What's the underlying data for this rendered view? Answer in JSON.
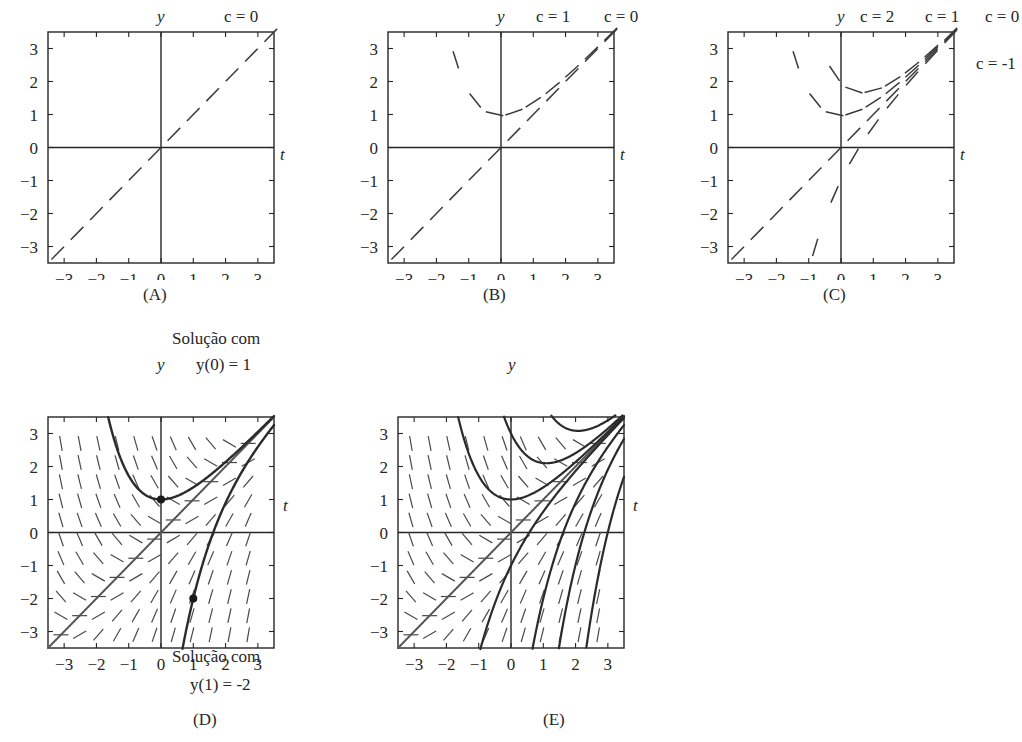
{
  "figure": {
    "background": "#ffffff",
    "ink": "#262626",
    "curve_color": "#3a3a3a",
    "accent_curve_color": "#555555"
  },
  "axes_common": {
    "x_ticks": [
      "-3",
      "-2",
      "-1",
      "0",
      "1",
      "2",
      "3"
    ],
    "y_ticks": [
      "3",
      "2",
      "1",
      "0",
      "-1",
      "-2",
      "-3"
    ],
    "x_label": "t",
    "y_label": "y",
    "xlim": [
      -3.5,
      3.5
    ],
    "ylim": [
      -3.5,
      3.5
    ]
  },
  "panels": [
    {
      "id": "A",
      "caption": "(A)",
      "curve_labels": [
        "c = 0"
      ],
      "has_direction_field": false,
      "has_solution_curves": false,
      "dashed_curves": [
        {
          "c": 0,
          "label": "c = 0",
          "label_x": 0.76,
          "style": "dashed"
        }
      ]
    },
    {
      "id": "B",
      "caption": "(B)",
      "curve_labels": [
        "c = 1",
        "c = 0"
      ],
      "has_direction_field": false,
      "has_solution_curves": false,
      "dashed_curves": [
        {
          "c": 1,
          "label": "c = 1",
          "label_x": 0.57,
          "style": "dashed"
        },
        {
          "c": 0,
          "label": "c = 0",
          "label_x": 0.84,
          "style": "dashed"
        }
      ]
    },
    {
      "id": "C",
      "caption": "(C)",
      "curve_labels": [
        "c = 2",
        "c = 1",
        "c = 0",
        "c = -1"
      ],
      "has_direction_field": false,
      "has_solution_curves": false,
      "dashed_curves": [
        {
          "c": 2,
          "label": "c = 2",
          "label_x": 0.41,
          "style": "dashed"
        },
        {
          "c": 1,
          "label": "c = 1",
          "label_x": 0.62,
          "style": "dashed"
        },
        {
          "c": 0,
          "label": "c = 0",
          "label_x": 0.83,
          "style": "dashed"
        },
        {
          "c": -1,
          "label": "c = -1",
          "label_x": 1.02,
          "style": "dashed"
        }
      ]
    },
    {
      "id": "D",
      "caption": "(D)",
      "has_direction_field": true,
      "has_solution_curves": true,
      "annotation_top": {
        "line1": "Solução com",
        "line2": "y(0) = 1"
      },
      "annotation_bottom": {
        "line1": "Solução com",
        "line2": "y(1) = -2"
      },
      "marked_points": [
        {
          "t": 0,
          "y": 1
        },
        {
          "t": 1,
          "y": -2
        }
      ]
    },
    {
      "id": "E",
      "caption": "(E)",
      "has_direction_field": true,
      "has_solution_curves": true,
      "curve_count": 7
    }
  ],
  "chart_data": {
    "type": "line",
    "title": "",
    "xlabel": "t",
    "ylabel": "y",
    "xlim": [
      -3.5,
      3.5
    ],
    "ylim": [
      -3.5,
      3.5
    ],
    "grid": false,
    "legend": "inline-curve-labels",
    "xticks": [
      -3,
      -2,
      -1,
      0,
      1,
      2,
      3
    ],
    "yticks": [
      -3,
      -2,
      -1,
      0,
      1,
      2,
      3
    ],
    "panels": [
      {
        "id": "A",
        "series": [
          {
            "name": "c = 0",
            "style": "dashed",
            "c": 0
          }
        ]
      },
      {
        "id": "B",
        "series": [
          {
            "name": "c = 0",
            "style": "dashed",
            "c": 0
          },
          {
            "name": "c = 1",
            "style": "dashed",
            "c": 1
          }
        ]
      },
      {
        "id": "C",
        "series": [
          {
            "name": "c = 0",
            "style": "dashed",
            "c": 0
          },
          {
            "name": "c = 1",
            "style": "dashed",
            "c": 1
          },
          {
            "name": "c = 2",
            "style": "dashed",
            "c": 2
          },
          {
            "name": "c = -1",
            "style": "dashed",
            "c": -1
          }
        ]
      },
      {
        "id": "D",
        "direction_field": true,
        "series": [
          {
            "name": "Solução com y(0) = 1",
            "style": "solid",
            "through": [
              0,
              1
            ]
          },
          {
            "name": "Solução com y(1) = -2",
            "style": "solid",
            "through": [
              1,
              -2
            ]
          }
        ]
      },
      {
        "id": "E",
        "direction_field": true,
        "series": [
          {
            "name": "curve-1",
            "style": "solid"
          },
          {
            "name": "curve-2",
            "style": "solid"
          },
          {
            "name": "curve-3",
            "style": "solid"
          },
          {
            "name": "curve-4",
            "style": "solid"
          },
          {
            "name": "curve-5",
            "style": "solid"
          },
          {
            "name": "curve-6",
            "style": "solid"
          },
          {
            "name": "curve-7",
            "style": "solid"
          }
        ]
      }
    ]
  }
}
